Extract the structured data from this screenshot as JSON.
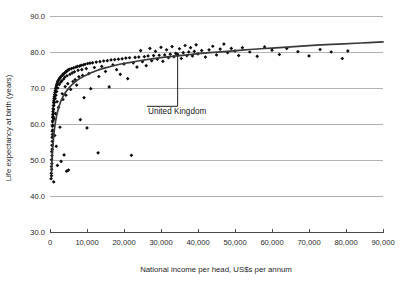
{
  "chart_data": {
    "type": "scatter",
    "title": "",
    "xlabel": "National income per head, US$s per annum",
    "ylabel": "Life expectancy at birth (years)",
    "xlim": [
      0,
      90000
    ],
    "ylim": [
      30.0,
      90.0
    ],
    "xticks": [
      0,
      10000,
      20000,
      30000,
      40000,
      50000,
      60000,
      70000,
      80000,
      90000
    ],
    "xticklabels": [
      "0",
      "10,000",
      "20,000",
      "30,000",
      "40,000",
      "50,000",
      "60,000",
      "70,000",
      "80,000",
      "90,000"
    ],
    "yticks": [
      30.0,
      40.0,
      50.0,
      60.0,
      70.0,
      80.0,
      90.0
    ],
    "yticklabels": [
      "30.0",
      "40.0",
      "50.0",
      "60.0",
      "70.0",
      "80.0",
      "90.0"
    ],
    "grid": "horizontal",
    "gridlines_y": [
      40.0,
      50.0,
      60.0,
      70.0,
      80.0,
      90.0
    ],
    "legend": "none",
    "marker": "diamond",
    "marker_color": "#0d0d0d",
    "curve_color": "#3a3a3a",
    "grid_color": "#9d9d9d",
    "axis_color": "#4a4a4a",
    "background_color": "#ffffff",
    "annotations": [
      {
        "label": "United Kingdom",
        "point_x": 34500,
        "point_y": 79.4,
        "label_x": 26500,
        "label_y": 63.8
      }
    ],
    "trendline": {
      "kind": "logarithmic",
      "points": [
        [
          400,
          46.5
        ],
        [
          600,
          51.0
        ],
        [
          900,
          55.5
        ],
        [
          1200,
          58.6
        ],
        [
          1600,
          61.3
        ],
        [
          2100,
          63.7
        ],
        [
          2700,
          65.7
        ],
        [
          3400,
          67.4
        ],
        [
          4200,
          68.8
        ],
        [
          5200,
          70.1
        ],
        [
          6500,
          71.4
        ],
        [
          8000,
          72.6
        ],
        [
          10000,
          73.7
        ],
        [
          12500,
          74.8
        ],
        [
          15000,
          75.6
        ],
        [
          18000,
          76.4
        ],
        [
          21000,
          77.0
        ],
        [
          25000,
          77.7
        ],
        [
          29000,
          78.3
        ],
        [
          33000,
          78.8
        ],
        [
          38000,
          79.3
        ],
        [
          43000,
          79.8
        ],
        [
          48000,
          80.2
        ],
        [
          54000,
          80.7
        ],
        [
          60000,
          81.1
        ],
        [
          66000,
          81.5
        ],
        [
          72000,
          81.9
        ],
        [
          78000,
          82.2
        ],
        [
          84000,
          82.5
        ],
        [
          90000,
          82.8
        ]
      ]
    },
    "points": [
      [
        300,
        44.8
      ],
      [
        350,
        46.3
      ],
      [
        380,
        48.2
      ],
      [
        400,
        45.6
      ],
      [
        420,
        50.1
      ],
      [
        450,
        47.4
      ],
      [
        470,
        52.3
      ],
      [
        500,
        49.0
      ],
      [
        520,
        54.1
      ],
      [
        540,
        51.2
      ],
      [
        560,
        56.3
      ],
      [
        580,
        53.0
      ],
      [
        600,
        58.0
      ],
      [
        620,
        55.2
      ],
      [
        640,
        59.4
      ],
      [
        660,
        57.1
      ],
      [
        680,
        60.6
      ],
      [
        700,
        58.3
      ],
      [
        720,
        61.8
      ],
      [
        740,
        59.7
      ],
      [
        760,
        62.6
      ],
      [
        780,
        61.0
      ],
      [
        800,
        63.5
      ],
      [
        830,
        62.1
      ],
      [
        860,
        64.3
      ],
      [
        890,
        63.0
      ],
      [
        920,
        65.1
      ],
      [
        950,
        64.0
      ],
      [
        980,
        65.9
      ],
      [
        1000,
        43.9
      ],
      [
        1020,
        66.4
      ],
      [
        1050,
        65.2
      ],
      [
        1080,
        67.0
      ],
      [
        1100,
        61.5
      ],
      [
        1150,
        67.6
      ],
      [
        1200,
        66.0
      ],
      [
        1250,
        68.2
      ],
      [
        1300,
        56.8
      ],
      [
        1350,
        68.8
      ],
      [
        1400,
        67.1
      ],
      [
        1450,
        69.3
      ],
      [
        1500,
        62.9
      ],
      [
        1550,
        69.8
      ],
      [
        1600,
        68.0
      ],
      [
        1650,
        70.2
      ],
      [
        1700,
        53.8
      ],
      [
        1750,
        70.6
      ],
      [
        1800,
        69.0
      ],
      [
        1850,
        71.0
      ],
      [
        1900,
        66.2
      ],
      [
        1950,
        71.3
      ],
      [
        2000,
        48.5
      ],
      [
        2050,
        71.7
      ],
      [
        2100,
        70.0
      ],
      [
        2200,
        72.0
      ],
      [
        2300,
        64.6
      ],
      [
        2400,
        72.4
      ],
      [
        2500,
        71.0
      ],
      [
        2600,
        72.7
      ],
      [
        2700,
        59.1
      ],
      [
        2800,
        73.0
      ],
      [
        2900,
        71.6
      ],
      [
        3000,
        49.6
      ],
      [
        3100,
        73.3
      ],
      [
        3200,
        72.0
      ],
      [
        3300,
        68.4
      ],
      [
        3400,
        73.6
      ],
      [
        3500,
        66.8
      ],
      [
        3600,
        73.9
      ],
      [
        3700,
        72.5
      ],
      [
        3800,
        51.4
      ],
      [
        3900,
        74.1
      ],
      [
        4000,
        73.0
      ],
      [
        4100,
        70.4
      ],
      [
        4200,
        74.4
      ],
      [
        4300,
        68.0
      ],
      [
        4400,
        74.6
      ],
      [
        4500,
        46.9
      ],
      [
        4600,
        73.4
      ],
      [
        4700,
        74.8
      ],
      [
        4800,
        71.2
      ],
      [
        4900,
        75.0
      ],
      [
        5000,
        47.2
      ],
      [
        5200,
        75.2
      ],
      [
        5400,
        73.8
      ],
      [
        5600,
        69.6
      ],
      [
        5800,
        75.4
      ],
      [
        6000,
        74.2
      ],
      [
        6200,
        71.8
      ],
      [
        6400,
        75.6
      ],
      [
        6600,
        74.5
      ],
      [
        6800,
        72.3
      ],
      [
        7000,
        75.8
      ],
      [
        7200,
        70.8
      ],
      [
        7400,
        76.0
      ],
      [
        7600,
        74.9
      ],
      [
        7800,
        73.1
      ],
      [
        8000,
        76.1
      ],
      [
        8200,
        61.2
      ],
      [
        8400,
        76.3
      ],
      [
        8600,
        75.1
      ],
      [
        8800,
        73.5
      ],
      [
        9000,
        76.4
      ],
      [
        9200,
        67.3
      ],
      [
        9500,
        76.6
      ],
      [
        9800,
        75.4
      ],
      [
        10000,
        58.9
      ],
      [
        10200,
        76.8
      ],
      [
        10500,
        74.0
      ],
      [
        10800,
        76.9
      ],
      [
        11000,
        69.8
      ],
      [
        11500,
        77.0
      ],
      [
        12000,
        75.7
      ],
      [
        12500,
        77.2
      ],
      [
        13000,
        52.0
      ],
      [
        13200,
        73.2
      ],
      [
        13500,
        77.3
      ],
      [
        14000,
        76.0
      ],
      [
        14500,
        77.5
      ],
      [
        15000,
        74.6
      ],
      [
        15500,
        77.6
      ],
      [
        16000,
        70.3
      ],
      [
        16500,
        77.8
      ],
      [
        17000,
        76.4
      ],
      [
        17500,
        77.9
      ],
      [
        18000,
        75.1
      ],
      [
        18500,
        78.0
      ],
      [
        19000,
        73.8
      ],
      [
        19500,
        78.1
      ],
      [
        20000,
        76.7
      ],
      [
        20500,
        78.3
      ],
      [
        21000,
        72.6
      ],
      [
        21500,
        78.4
      ],
      [
        22000,
        51.3
      ],
      [
        22500,
        77.0
      ],
      [
        23000,
        78.5
      ],
      [
        23500,
        75.8
      ],
      [
        24000,
        78.6
      ],
      [
        24500,
        80.4
      ],
      [
        25000,
        77.3
      ],
      [
        25500,
        78.7
      ],
      [
        26000,
        76.2
      ],
      [
        26500,
        78.9
      ],
      [
        27000,
        81.0
      ],
      [
        27500,
        77.6
      ],
      [
        28000,
        79.0
      ],
      [
        28500,
        80.2
      ],
      [
        29000,
        78.0
      ],
      [
        29500,
        79.1
      ],
      [
        30000,
        81.3
      ],
      [
        30500,
        77.4
      ],
      [
        31000,
        79.2
      ],
      [
        31500,
        80.6
      ],
      [
        32000,
        78.4
      ],
      [
        32500,
        79.4
      ],
      [
        33000,
        81.5
      ],
      [
        33500,
        78.7
      ],
      [
        34000,
        79.6
      ],
      [
        34500,
        79.4
      ],
      [
        35000,
        80.9
      ],
      [
        35500,
        78.2
      ],
      [
        36000,
        79.8
      ],
      [
        36500,
        81.8
      ],
      [
        37000,
        79.0
      ],
      [
        37500,
        80.0
      ],
      [
        38000,
        81.2
      ],
      [
        38500,
        78.9
      ],
      [
        39000,
        80.2
      ],
      [
        39500,
        82.0
      ],
      [
        40000,
        79.5
      ],
      [
        41000,
        80.4
      ],
      [
        42000,
        78.6
      ],
      [
        43000,
        80.6
      ],
      [
        44000,
        81.6
      ],
      [
        45000,
        79.2
      ],
      [
        46000,
        80.8
      ],
      [
        47000,
        82.2
      ],
      [
        48000,
        79.8
      ],
      [
        49000,
        81.0
      ],
      [
        50000,
        80.3
      ],
      [
        51000,
        79.0
      ],
      [
        52000,
        81.2
      ],
      [
        54000,
        80.0
      ],
      [
        56000,
        78.8
      ],
      [
        58000,
        81.4
      ],
      [
        60000,
        80.5
      ],
      [
        62000,
        79.3
      ],
      [
        64000,
        81.0
      ],
      [
        67000,
        80.1
      ],
      [
        70000,
        78.9
      ],
      [
        73000,
        80.7
      ],
      [
        76000,
        80.0
      ],
      [
        79000,
        78.2
      ],
      [
        80500,
        80.3
      ]
    ]
  }
}
